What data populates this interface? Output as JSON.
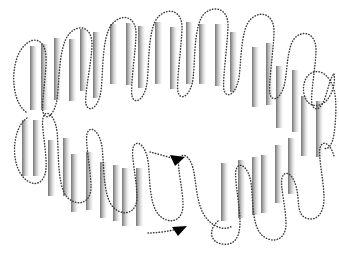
{
  "figure": {
    "name": "serpentine-strand-topology-diagram",
    "type": "diagram",
    "width": 339,
    "height": 257,
    "background_color": "#ffffff"
  },
  "style": {
    "bar_gradient_dark": "#6e6e6e",
    "bar_gradient_mid": "#b4b4b4",
    "bar_gradient_light": "#fcfcfc",
    "path_color": "#3a3a3a",
    "path_stroke_width": 1.45,
    "path_dash": "0.45 2.35",
    "arrow_color": "#000000"
  },
  "bars": [
    {
      "x": 30,
      "y": 46,
      "w": 7,
      "h": 64
    },
    {
      "x": 41,
      "y": 44,
      "w": 7,
      "h": 66
    },
    {
      "x": 54,
      "y": 38,
      "w": 7,
      "h": 62
    },
    {
      "x": 69,
      "y": 39,
      "w": 7,
      "h": 62
    },
    {
      "x": 80,
      "y": 29,
      "w": 7,
      "h": 62
    },
    {
      "x": 93,
      "y": 32,
      "w": 7,
      "h": 66
    },
    {
      "x": 110,
      "y": 24,
      "w": 7,
      "h": 60
    },
    {
      "x": 126,
      "y": 23,
      "w": 7,
      "h": 62
    },
    {
      "x": 138,
      "y": 26,
      "w": 7,
      "h": 62
    },
    {
      "x": 155,
      "y": 22,
      "w": 7,
      "h": 62
    },
    {
      "x": 170,
      "y": 27,
      "w": 7,
      "h": 62
    },
    {
      "x": 186,
      "y": 22,
      "w": 7,
      "h": 62
    },
    {
      "x": 199,
      "y": 24,
      "w": 7,
      "h": 60
    },
    {
      "x": 215,
      "y": 24,
      "w": 7,
      "h": 62
    },
    {
      "x": 230,
      "y": 32,
      "w": 7,
      "h": 60
    },
    {
      "x": 252,
      "y": 47,
      "w": 7,
      "h": 60
    },
    {
      "x": 266,
      "y": 43,
      "w": 7,
      "h": 62
    },
    {
      "x": 276,
      "y": 66,
      "w": 7,
      "h": 62
    },
    {
      "x": 292,
      "y": 70,
      "w": 7,
      "h": 62
    },
    {
      "x": 301,
      "y": 96,
      "w": 7,
      "h": 60
    },
    {
      "x": 316,
      "y": 101,
      "w": 7,
      "h": 56
    },
    {
      "x": 22,
      "y": 120,
      "w": 7,
      "h": 56
    },
    {
      "x": 33,
      "y": 120,
      "w": 7,
      "h": 56
    },
    {
      "x": 48,
      "y": 140,
      "w": 7,
      "h": 56
    },
    {
      "x": 63,
      "y": 138,
      "w": 7,
      "h": 58
    },
    {
      "x": 71,
      "y": 154,
      "w": 7,
      "h": 58
    },
    {
      "x": 86,
      "y": 152,
      "w": 7,
      "h": 58
    },
    {
      "x": 100,
      "y": 162,
      "w": 7,
      "h": 56
    },
    {
      "x": 113,
      "y": 165,
      "w": 7,
      "h": 56
    },
    {
      "x": 122,
      "y": 168,
      "w": 7,
      "h": 58
    },
    {
      "x": 136,
      "y": 168,
      "w": 7,
      "h": 58
    },
    {
      "x": 221,
      "y": 163,
      "w": 7,
      "h": 58
    },
    {
      "x": 238,
      "y": 160,
      "w": 7,
      "h": 58
    },
    {
      "x": 252,
      "y": 157,
      "w": 7,
      "h": 58
    },
    {
      "x": 261,
      "y": 155,
      "w": 7,
      "h": 58
    },
    {
      "x": 275,
      "y": 145,
      "w": 7,
      "h": 58
    },
    {
      "x": 288,
      "y": 138,
      "w": 7,
      "h": 56
    }
  ],
  "paths": [
    {
      "name": "upper-serpentine-path",
      "d": "M 26,112 C 10,100 10,60 24,46 C 34,35 45,40 46,56 C 47,72 41,104 43,112 C 45,120 52,118 56,104 C 60,90 57,46 70,33 C 80,23 92,28 92,44 C 92,60 84,96 86,104 C 88,112 96,110 100,96 C 104,82 100,36 113,23 C 123,13 136,17 136,33 C 136,49 130,88 132,96 C 134,104 142,102 146,88 C 150,74 146,28 159,16 C 169,7 182,11 182,27 C 182,43 176,84 178,92 C 180,100 188,98 192,84 C 196,70 192,24 205,13 C 215,5 228,9 228,25 C 228,41 222,82 224,90 C 226,98 234,96 238,82 C 242,68 239,28 252,18 C 262,10 274,15 274,31 C 274,47 268,86 270,94 C 272,102 280,100 284,86 C 288,72 286,44 297,36 C 306,30 316,35 316,50 C 316,65 310,96 312,104 C 314,112 321,110 325,98 C 329,86 330,78 334,74"
    },
    {
      "name": "lower-serpentine-path",
      "d": "M 27,118 C 12,128 10,164 24,178 C 34,188 45,184 46,168 C 47,152 41,126 43,118 C 45,110 52,112 56,126 C 60,140 55,186 68,198 C 78,207 91,203 91,187 C 91,171 85,142 87,134 C 89,126 97,128 101,142 C 105,156 101,196 114,208 C 124,217 137,213 137,197 C 137,181 131,156 133,148 C 135,140 143,142 147,156 C 151,170 147,204 160,216 C 170,225 183,221 183,205 C 183,189 177,168 179,160 C 181,152 189,154 193,168 C 196,179 196,200 203,213 C 210,226 224,232 232,226"
    },
    {
      "name": "lower-right-serpentine-path",
      "d": "M 218,221 C 208,230 210,242 222,244 C 234,246 240,238 240,222 C 240,206 234,178 236,170 C 238,162 246,164 250,178 C 254,192 250,226 263,236 C 273,244 286,240 286,224 C 286,208 280,186 282,178 C 284,170 292,172 296,186 C 300,200 296,214 306,218 C 316,222 324,214 324,198 C 324,182 318,156 320,148 C 322,140 330,142 334,156"
    },
    {
      "name": "upper-right-connector-path",
      "d": "M 334,74 C 336,86 330,100 322,104 C 314,108 306,104 304,94 C 302,84 306,74 314,72 C 322,70 330,76 334,90 C 337,100 336,120 334,134 C 332,146 328,150 324,148"
    },
    {
      "name": "arrow-1-tail",
      "d": "M 150,152 C 158,154 168,157 176,159"
    },
    {
      "name": "arrow-2-tail",
      "d": "M 148,233 C 158,233 170,231 178,229"
    }
  ],
  "arrows": [
    {
      "name": "arrowhead-upper",
      "points": "185,157 170,155 175,166"
    },
    {
      "name": "arrowhead-lower",
      "points": "187,226 172,227 178,236"
    }
  ]
}
